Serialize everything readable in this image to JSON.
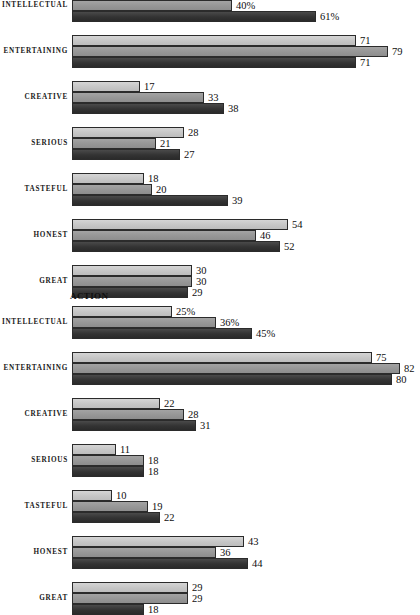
{
  "chart_data": [
    {
      "type": "bar",
      "title": "",
      "orientation": "horizontal",
      "xlabel": "",
      "ylabel": "",
      "xlim": [
        0,
        87
      ],
      "grid": false,
      "legend": "none",
      "value_suffix_first_group": "%",
      "categories": [
        "INTELLECTUAL",
        "ENTERTAINING",
        "CREATIVE",
        "SERIOUS",
        "TASTEFUL",
        "HONEST",
        "GREAT"
      ],
      "series": [
        {
          "name": "series-1",
          "shade": "light",
          "values": [
            null,
            71,
            17,
            28,
            18,
            54,
            30
          ]
        },
        {
          "name": "series-2",
          "shade": "medium",
          "values": [
            40,
            79,
            33,
            21,
            20,
            46,
            30
          ]
        },
        {
          "name": "series-3",
          "shade": "dark",
          "values": [
            61,
            71,
            38,
            27,
            39,
            52,
            29
          ]
        }
      ],
      "labels": [
        [
          "",
          "40%",
          "61%"
        ],
        [
          "71",
          "79",
          "71"
        ],
        [
          "17",
          "33",
          "38"
        ],
        [
          "28",
          "21",
          "27"
        ],
        [
          "18",
          "20",
          "39"
        ],
        [
          "54",
          "46",
          "52"
        ],
        [
          "30",
          "30",
          "29"
        ]
      ]
    },
    {
      "type": "bar",
      "title": "ACTION",
      "orientation": "horizontal",
      "xlabel": "",
      "ylabel": "",
      "xlim": [
        0,
        87
      ],
      "grid": false,
      "legend": "none",
      "value_suffix_first_group": "%",
      "categories": [
        "INTELLECTUAL",
        "ENTERTAINING",
        "CREATIVE",
        "SERIOUS",
        "TASTEFUL",
        "HONEST",
        "GREAT"
      ],
      "series": [
        {
          "name": "series-1",
          "shade": "light",
          "values": [
            25,
            75,
            22,
            11,
            10,
            43,
            29
          ]
        },
        {
          "name": "series-2",
          "shade": "medium",
          "values": [
            36,
            82,
            28,
            18,
            19,
            36,
            29
          ]
        },
        {
          "name": "series-3",
          "shade": "dark",
          "values": [
            45,
            80,
            31,
            18,
            22,
            44,
            18
          ]
        }
      ],
      "labels": [
        [
          "25%",
          "36%",
          "45%"
        ],
        [
          "75",
          "82",
          "80"
        ],
        [
          "22",
          "28",
          "31"
        ],
        [
          "11",
          "18",
          "18"
        ],
        [
          "10",
          "19",
          "22"
        ],
        [
          "43",
          "36",
          "44"
        ],
        [
          "29",
          "29",
          "18"
        ]
      ]
    }
  ],
  "colors": {
    "series_light": "#c6c6c6",
    "series_medium": "#969696",
    "series_dark": "#333333",
    "bar_outline": "#2b2b2b",
    "text": "#111111",
    "background": "#ffffff"
  },
  "panels": [
    {
      "id": "panel-top",
      "title": "",
      "groups": [
        {
          "category": "INTELLECTUAL",
          "clipped_top": true,
          "bars": [
            {
              "series": "series-1",
              "shade": "light",
              "value": null,
              "label": "",
              "clipped": true
            },
            {
              "series": "series-2",
              "shade": "medium",
              "value": 40,
              "label": "40%"
            },
            {
              "series": "series-3",
              "shade": "dark",
              "value": 61,
              "label": "61%"
            }
          ]
        },
        {
          "category": "ENTERTAINING",
          "bars": [
            {
              "series": "series-1",
              "shade": "light",
              "value": 71,
              "label": "71"
            },
            {
              "series": "series-2",
              "shade": "medium",
              "value": 79,
              "label": "79"
            },
            {
              "series": "series-3",
              "shade": "dark",
              "value": 71,
              "label": "71"
            }
          ]
        },
        {
          "category": "CREATIVE",
          "bars": [
            {
              "series": "series-1",
              "shade": "light",
              "value": 17,
              "label": "17"
            },
            {
              "series": "series-2",
              "shade": "medium",
              "value": 33,
              "label": "33"
            },
            {
              "series": "series-3",
              "shade": "dark",
              "value": 38,
              "label": "38"
            }
          ]
        },
        {
          "category": "SERIOUS",
          "bars": [
            {
              "series": "series-1",
              "shade": "light",
              "value": 28,
              "label": "28"
            },
            {
              "series": "series-2",
              "shade": "medium",
              "value": 21,
              "label": "21"
            },
            {
              "series": "series-3",
              "shade": "dark",
              "value": 27,
              "label": "27"
            }
          ]
        },
        {
          "category": "TASTEFUL",
          "bars": [
            {
              "series": "series-1",
              "shade": "light",
              "value": 18,
              "label": "18"
            },
            {
              "series": "series-2",
              "shade": "medium",
              "value": 20,
              "label": "20"
            },
            {
              "series": "series-3",
              "shade": "dark",
              "value": 39,
              "label": "39"
            }
          ]
        },
        {
          "category": "HONEST",
          "bars": [
            {
              "series": "series-1",
              "shade": "light",
              "value": 54,
              "label": "54"
            },
            {
              "series": "series-2",
              "shade": "medium",
              "value": 46,
              "label": "46"
            },
            {
              "series": "series-3",
              "shade": "dark",
              "value": 52,
              "label": "52"
            }
          ]
        },
        {
          "category": "GREAT",
          "bars": [
            {
              "series": "series-1",
              "shade": "light",
              "value": 30,
              "label": "30"
            },
            {
              "series": "series-2",
              "shade": "medium",
              "value": 30,
              "label": "30"
            },
            {
              "series": "series-3",
              "shade": "dark",
              "value": 29,
              "label": "29"
            }
          ]
        }
      ]
    },
    {
      "id": "panel-action",
      "title": "ACTION",
      "groups": [
        {
          "category": "INTELLECTUAL",
          "bars": [
            {
              "series": "series-1",
              "shade": "light",
              "value": 25,
              "label": "25%"
            },
            {
              "series": "series-2",
              "shade": "medium",
              "value": 36,
              "label": "36%"
            },
            {
              "series": "series-3",
              "shade": "dark",
              "value": 45,
              "label": "45%"
            }
          ]
        },
        {
          "category": "ENTERTAINING",
          "bars": [
            {
              "series": "series-1",
              "shade": "light",
              "value": 75,
              "label": "75"
            },
            {
              "series": "series-2",
              "shade": "medium",
              "value": 82,
              "label": "82"
            },
            {
              "series": "series-3",
              "shade": "dark",
              "value": 80,
              "label": "80"
            }
          ]
        },
        {
          "category": "CREATIVE",
          "bars": [
            {
              "series": "series-1",
              "shade": "light",
              "value": 22,
              "label": "22"
            },
            {
              "series": "series-2",
              "shade": "medium",
              "value": 28,
              "label": "28"
            },
            {
              "series": "series-3",
              "shade": "dark",
              "value": 31,
              "label": "31"
            }
          ]
        },
        {
          "category": "SERIOUS",
          "bars": [
            {
              "series": "series-1",
              "shade": "light",
              "value": 11,
              "label": "11"
            },
            {
              "series": "series-2",
              "shade": "medium",
              "value": 18,
              "label": "18"
            },
            {
              "series": "series-3",
              "shade": "dark",
              "value": 18,
              "label": "18"
            }
          ]
        },
        {
          "category": "TASTEFUL",
          "bars": [
            {
              "series": "series-1",
              "shade": "light",
              "value": 10,
              "label": "10"
            },
            {
              "series": "series-2",
              "shade": "medium",
              "value": 19,
              "label": "19"
            },
            {
              "series": "series-3",
              "shade": "dark",
              "value": 22,
              "label": "22"
            }
          ]
        },
        {
          "category": "HONEST",
          "bars": [
            {
              "series": "series-1",
              "shade": "light",
              "value": 43,
              "label": "43"
            },
            {
              "series": "series-2",
              "shade": "medium",
              "value": 36,
              "label": "36"
            },
            {
              "series": "series-3",
              "shade": "dark",
              "value": 44,
              "label": "44"
            }
          ]
        },
        {
          "category": "GREAT",
          "bars": [
            {
              "series": "series-1",
              "shade": "light",
              "value": 29,
              "label": "29"
            },
            {
              "series": "series-2",
              "shade": "medium",
              "value": 29,
              "label": "29"
            },
            {
              "series": "series-3",
              "shade": "dark",
              "value": 18,
              "label": "18"
            }
          ]
        }
      ]
    }
  ],
  "geometry": {
    "origin_x": 72,
    "px_per_unit": 4.0,
    "bar_height": 11,
    "group_height": 33,
    "group_gap": 13,
    "panel_top_y": -11,
    "panel_action_title_y": 291,
    "panel_action_y": 306
  }
}
